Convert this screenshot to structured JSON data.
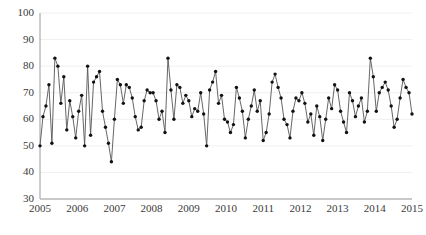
{
  "chart_data": {
    "type": "line",
    "title": "",
    "subtitle": "",
    "xlabel": "",
    "ylabel": "",
    "grid": true,
    "legend": null,
    "marker": "filled-circle",
    "line_color": "#555555",
    "marker_color": "#111111",
    "xlim": [
      2005.0,
      2015.0
    ],
    "ylim": [
      30,
      100
    ],
    "yticks": [
      30,
      40,
      50,
      60,
      70,
      80,
      90,
      100
    ],
    "ytick_labels": [
      "30",
      "40",
      "50",
      "60",
      "70",
      "80",
      "90",
      "100"
    ],
    "xticks": [
      2005,
      2006,
      2007,
      2008,
      2009,
      2010,
      2011,
      2012,
      2013,
      2014,
      2015
    ],
    "xtick_labels": [
      "2005",
      "2006",
      "2007",
      "2008",
      "2009",
      "2010",
      "2011",
      "2012",
      "2013",
      "2014",
      "2015"
    ],
    "x_start": 2005.0,
    "x_step": 0.0833,
    "series": [
      {
        "name": "series-1",
        "values": [
          50,
          61,
          65,
          73,
          51,
          83,
          80,
          66,
          76,
          56,
          67,
          61,
          53,
          63,
          69,
          50,
          80,
          54,
          74,
          76,
          78,
          63,
          57,
          51,
          44,
          60,
          75,
          73,
          66,
          73,
          72,
          68,
          61,
          56,
          57,
          67,
          71,
          70,
          70,
          67,
          60,
          63,
          55,
          83,
          71,
          60,
          73,
          72,
          66,
          69,
          67,
          61,
          64,
          63,
          70,
          62,
          50,
          71,
          74,
          78,
          66,
          69,
          60,
          59,
          55,
          58,
          72,
          68,
          63,
          53,
          60,
          65,
          71,
          63,
          67,
          52,
          55,
          62,
          74,
          77,
          72,
          68,
          60,
          58,
          53,
          63,
          68,
          67,
          70,
          66,
          59,
          62,
          54,
          65,
          61,
          52,
          60,
          68,
          64,
          73,
          71,
          63,
          59,
          55,
          70,
          67,
          61,
          65,
          68,
          59,
          63,
          83,
          76,
          63,
          70,
          72,
          74,
          71,
          65,
          57,
          60,
          68,
          75,
          72,
          70,
          62
        ]
      }
    ]
  },
  "axes": {
    "y_axis_name": "y-axis",
    "x_axis_name": "x-axis"
  }
}
